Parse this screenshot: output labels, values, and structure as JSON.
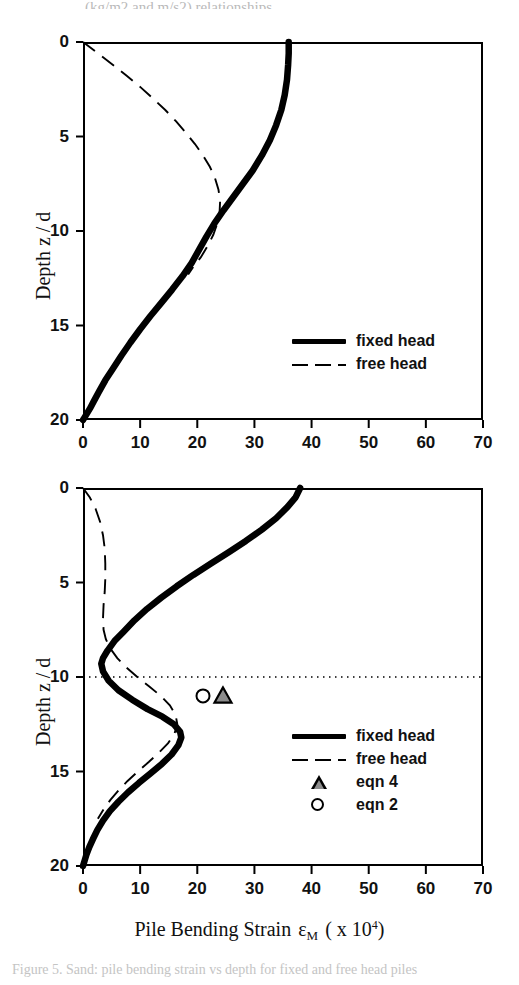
{
  "figure": {
    "top_clipped_text": "(kg/m2 and m/s2) relationships",
    "caption": "Figure 5. Sand: pile bending strain vs depth for fixed and free head piles"
  },
  "axes": {
    "x_label_main": "Pile  Bending  Strain",
    "x_label_symbol": "ε",
    "x_label_subscript": "M",
    "x_label_paren_open": "( x 10",
    "x_label_exponent": "4",
    "x_label_paren_close": ")",
    "y_label": "Depth  z / d",
    "x_ticks": [
      "0",
      "10",
      "20",
      "30",
      "40",
      "50",
      "60",
      "70"
    ],
    "y_ticks": [
      "0",
      "5",
      "10",
      "15",
      "20"
    ]
  },
  "legend_top": {
    "items": [
      {
        "label": "fixed head",
        "key": "thick-solid-line"
      },
      {
        "label": "free head",
        "key": "dashed-line"
      }
    ]
  },
  "legend_bottom": {
    "items": [
      {
        "label": "fixed head",
        "key": "thick-solid-line"
      },
      {
        "label": "free head",
        "key": "dashed-line"
      },
      {
        "label": "eqn 4",
        "key": "triangle-marker"
      },
      {
        "label": "eqn 2",
        "key": "circle-marker"
      }
    ]
  },
  "chart_data": [
    {
      "type": "line",
      "panel": "top",
      "title": "",
      "xlabel": "Pile Bending Strain εM ( x 10^4)",
      "ylabel": "Depth z / d",
      "xlim": [
        0,
        70
      ],
      "ylim": [
        20,
        0
      ],
      "y_inverted": true,
      "grid": false,
      "legend_position": "lower-right",
      "series": [
        {
          "name": "fixed head",
          "style": "thick-solid",
          "points": [
            [
              36.0,
              0.0
            ],
            [
              36.0,
              0.6
            ],
            [
              35.9,
              1.2
            ],
            [
              35.7,
              2.0
            ],
            [
              35.3,
              2.8
            ],
            [
              34.7,
              3.6
            ],
            [
              33.8,
              4.4
            ],
            [
              32.7,
              5.2
            ],
            [
              31.3,
              6.0
            ],
            [
              29.7,
              6.8
            ],
            [
              28.0,
              7.5
            ],
            [
              26.3,
              8.2
            ],
            [
              24.6,
              8.9
            ],
            [
              23.0,
              9.6
            ],
            [
              21.6,
              10.3
            ],
            [
              20.3,
              11.0
            ],
            [
              19.0,
              11.7
            ],
            [
              17.4,
              12.4
            ],
            [
              15.6,
              13.1
            ],
            [
              13.7,
              13.8
            ],
            [
              11.8,
              14.5
            ],
            [
              10.0,
              15.2
            ],
            [
              8.3,
              15.9
            ],
            [
              6.7,
              16.6
            ],
            [
              5.2,
              17.3
            ],
            [
              3.9,
              17.9
            ],
            [
              2.8,
              18.5
            ],
            [
              1.9,
              19.0
            ],
            [
              1.2,
              19.4
            ],
            [
              0.6,
              19.7
            ],
            [
              0.2,
              19.9
            ],
            [
              0.0,
              20.0
            ]
          ]
        },
        {
          "name": "free head",
          "style": "dashed",
          "points": [
            [
              0.0,
              0.0
            ],
            [
              2.6,
              0.6
            ],
            [
              5.2,
              1.2
            ],
            [
              7.7,
              1.8
            ],
            [
              10.1,
              2.4
            ],
            [
              12.3,
              3.0
            ],
            [
              14.4,
              3.6
            ],
            [
              16.3,
              4.2
            ],
            [
              18.0,
              4.8
            ],
            [
              19.6,
              5.4
            ],
            [
              21.0,
              6.0
            ],
            [
              22.2,
              6.6
            ],
            [
              23.1,
              7.2
            ],
            [
              23.7,
              7.8
            ],
            [
              24.0,
              8.4
            ],
            [
              23.9,
              9.0
            ],
            [
              23.5,
              9.6
            ],
            [
              22.8,
              10.2
            ],
            [
              21.8,
              10.8
            ],
            [
              20.6,
              11.4
            ],
            [
              19.3,
              11.9
            ],
            [
              18.4,
              12.3
            ]
          ]
        }
      ]
    },
    {
      "type": "line",
      "panel": "bottom",
      "title": "",
      "xlabel": "Pile Bending Strain εM ( x 10^4)",
      "ylabel": "Depth z / d",
      "xlim": [
        0,
        70
      ],
      "ylim": [
        20,
        0
      ],
      "y_inverted": true,
      "grid": false,
      "reference_line": {
        "axis": "y",
        "value": 10,
        "style": "dotted"
      },
      "legend_position": "lower-right",
      "series": [
        {
          "name": "fixed head",
          "style": "thick-solid",
          "points": [
            [
              38.0,
              0.0
            ],
            [
              37.2,
              0.5
            ],
            [
              35.8,
              1.0
            ],
            [
              33.8,
              1.6
            ],
            [
              31.3,
              2.2
            ],
            [
              28.5,
              2.8
            ],
            [
              25.5,
              3.4
            ],
            [
              22.4,
              4.0
            ],
            [
              19.3,
              4.6
            ],
            [
              16.4,
              5.2
            ],
            [
              13.7,
              5.8
            ],
            [
              11.2,
              6.4
            ],
            [
              9.0,
              7.0
            ],
            [
              7.1,
              7.6
            ],
            [
              5.5,
              8.1
            ],
            [
              4.3,
              8.6
            ],
            [
              3.5,
              9.0
            ],
            [
              3.2,
              9.3
            ],
            [
              3.5,
              9.7
            ],
            [
              4.5,
              10.2
            ],
            [
              6.2,
              10.7
            ],
            [
              8.6,
              11.2
            ],
            [
              11.3,
              11.7
            ],
            [
              13.9,
              12.1
            ],
            [
              15.9,
              12.5
            ],
            [
              17.0,
              12.9
            ],
            [
              17.2,
              13.2
            ],
            [
              16.7,
              13.6
            ],
            [
              15.5,
              14.1
            ],
            [
              13.8,
              14.6
            ],
            [
              11.8,
              15.1
            ],
            [
              9.8,
              15.6
            ],
            [
              7.9,
              16.1
            ],
            [
              6.2,
              16.6
            ],
            [
              4.7,
              17.1
            ],
            [
              3.5,
              17.6
            ],
            [
              2.5,
              18.1
            ],
            [
              1.7,
              18.6
            ],
            [
              1.1,
              19.0
            ],
            [
              0.6,
              19.4
            ],
            [
              0.3,
              19.7
            ],
            [
              0.0,
              20.0
            ]
          ]
        },
        {
          "name": "free head",
          "style": "dashed",
          "points": [
            [
              0.0,
              0.0
            ],
            [
              1.2,
              0.5
            ],
            [
              2.2,
              1.1
            ],
            [
              3.0,
              1.8
            ],
            [
              3.5,
              2.5
            ],
            [
              3.8,
              3.2
            ],
            [
              3.9,
              4.0
            ],
            [
              3.9,
              4.8
            ],
            [
              3.8,
              5.5
            ],
            [
              3.6,
              6.2
            ],
            [
              3.5,
              6.9
            ],
            [
              3.6,
              7.5
            ],
            [
              4.0,
              8.0
            ],
            [
              4.8,
              8.5
            ],
            [
              6.0,
              9.0
            ],
            [
              7.6,
              9.5
            ],
            [
              9.5,
              10.0
            ],
            [
              11.6,
              10.5
            ],
            [
              13.6,
              11.0
            ],
            [
              15.2,
              11.5
            ],
            [
              16.2,
              12.0
            ],
            [
              16.5,
              12.5
            ],
            [
              16.0,
              13.0
            ],
            [
              14.9,
              13.5
            ],
            [
              13.3,
              14.0
            ],
            [
              11.5,
              14.5
            ],
            [
              9.6,
              15.0
            ],
            [
              7.8,
              15.5
            ],
            [
              6.2,
              16.0
            ],
            [
              4.8,
              16.5
            ],
            [
              3.6,
              17.0
            ],
            [
              2.6,
              17.5
            ]
          ]
        },
        {
          "name": "eqn 4",
          "style": "triangle-marker",
          "points": [
            [
              24.5,
              11.0
            ]
          ]
        },
        {
          "name": "eqn 2",
          "style": "circle-marker",
          "points": [
            [
              21.0,
              11.0
            ]
          ]
        }
      ]
    }
  ]
}
